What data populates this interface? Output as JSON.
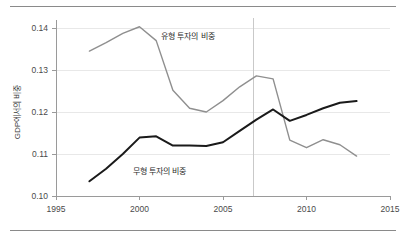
{
  "chart_data": {
    "type": "line",
    "title": "",
    "xlabel": "",
    "ylabel": "GDP에서의 비중",
    "xlim": [
      1995,
      2015
    ],
    "ylim": [
      0.1,
      0.14
    ],
    "grid": true,
    "legend_position": "inline-annotations",
    "x_ticks": [
      "1995",
      "2000",
      "2005",
      "2010",
      "2015"
    ],
    "y_ticks": [
      "0.10",
      "0.11",
      "0.12",
      "0.13",
      "0.14"
    ],
    "x": [
      1997,
      1998,
      1999,
      2000,
      2001,
      2002,
      2003,
      2004,
      2005,
      2006,
      2007,
      2008,
      2009,
      2010,
      2011,
      2012,
      2013
    ],
    "series": [
      {
        "name": "유형 투자의 비중",
        "color": "#8f8f8f",
        "values": [
          0.1345,
          0.1365,
          0.1387,
          0.1403,
          0.137,
          0.1252,
          0.1209,
          0.12,
          0.1227,
          0.126,
          0.1286,
          0.1279,
          0.1133,
          0.1115,
          0.1134,
          0.1122,
          0.1095
        ]
      },
      {
        "name": "무형 투자의 비중",
        "color": "#1a1a1a",
        "values": [
          0.1035,
          0.1065,
          0.11,
          0.1139,
          0.1142,
          0.112,
          0.112,
          0.1119,
          0.1128,
          0.1155,
          0.1182,
          0.1206,
          0.1179,
          0.1193,
          0.1209,
          0.1222,
          0.1226
        ]
      }
    ],
    "annotations": [
      {
        "text": "유형 투자의 비중",
        "x": 2001.3,
        "y": 0.1375
      },
      {
        "text": "무형 투자의 비중",
        "x": 1999.6,
        "y": 0.1053
      }
    ],
    "reference_line": {
      "x": 2006.8,
      "color": "#c9c9c9"
    }
  }
}
